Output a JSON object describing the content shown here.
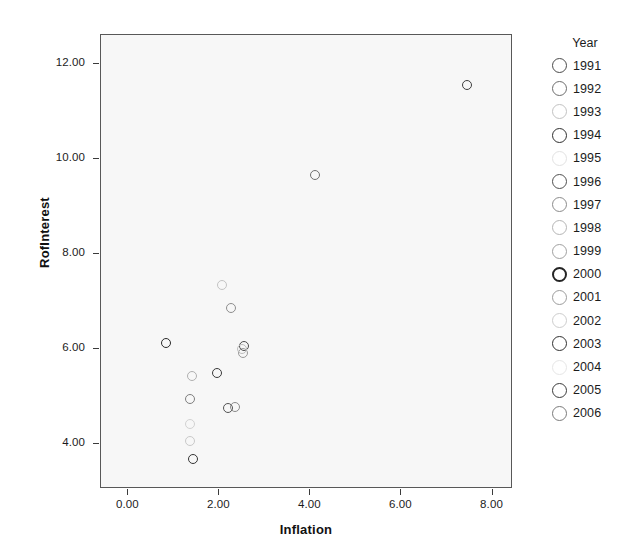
{
  "chart_data": {
    "type": "scatter",
    "title": "",
    "xlabel": "Inflation",
    "ylabel": "RofInterest",
    "xlim": [
      -0.6,
      8.45
    ],
    "ylim": [
      3.05,
      12.6
    ],
    "grid": false,
    "legend_position": "right",
    "legend_title": "Year",
    "xticks": [
      "0.00",
      "2.00",
      "4.00",
      "6.00",
      "8.00"
    ],
    "xtick_values": [
      0,
      2,
      4,
      6,
      8
    ],
    "yticks": [
      "4.00",
      "6.00",
      "8.00",
      "10.00",
      "12.00"
    ],
    "ytick_values": [
      4,
      6,
      8,
      10,
      12
    ],
    "series_name": "Year",
    "points": [
      {
        "label": "1991",
        "x": 7.45,
        "y": 11.55,
        "color": "#3f3f3f"
      },
      {
        "label": "1992",
        "x": 4.1,
        "y": 9.65,
        "color": "#707070"
      },
      {
        "label": "1993",
        "x": 2.05,
        "y": 7.35,
        "color": "#c3c3c3"
      },
      {
        "label": "1994",
        "x": 2.25,
        "y": 6.85,
        "color": "#8e8e8e"
      },
      {
        "label": "1995",
        "x": 0.82,
        "y": 6.12,
        "color": "#2b2b2b"
      },
      {
        "label": "1996",
        "x": 2.55,
        "y": 6.05,
        "color": "#4d4d4d"
      },
      {
        "label": "1997",
        "x": 2.52,
        "y": 5.92,
        "color": "#9a9a9a"
      },
      {
        "label": "1998",
        "x": 1.95,
        "y": 5.5,
        "color": "#3a3a3a"
      },
      {
        "label": "1999",
        "x": 1.4,
        "y": 5.42,
        "color": "#b0b0b0"
      },
      {
        "label": "2000",
        "x": 1.35,
        "y": 4.95,
        "color": "#7e7e7e"
      },
      {
        "label": "2001",
        "x": 2.18,
        "y": 4.75,
        "color": "#535353"
      },
      {
        "label": "2002",
        "x": 2.35,
        "y": 4.78,
        "color": "#8a8a8a"
      },
      {
        "label": "2003",
        "x": 1.35,
        "y": 4.42,
        "color": "#d2d2d2"
      },
      {
        "label": "2004",
        "x": 1.35,
        "y": 4.05,
        "color": "#c9c9c9"
      },
      {
        "label": "2005",
        "x": 1.42,
        "y": 3.68,
        "color": "#353535"
      },
      {
        "label": "2006",
        "x": 2.5,
        "y": 6.0,
        "color": "#bdbdbd"
      }
    ],
    "legend_entries": [
      {
        "label": "1991",
        "color": "#4a4a4a",
        "weight": 1.6
      },
      {
        "label": "1992",
        "color": "#6d6d6d",
        "weight": 1.4
      },
      {
        "label": "1993",
        "color": "#c2c2c2",
        "weight": 1.3
      },
      {
        "label": "1994",
        "color": "#2f2f2f",
        "weight": 1.9
      },
      {
        "label": "1995",
        "color": "#e2e2e2",
        "weight": 1.2
      },
      {
        "label": "1996",
        "color": "#4f4f4f",
        "weight": 1.7
      },
      {
        "label": "1997",
        "color": "#8b8b8b",
        "weight": 1.4
      },
      {
        "label": "1998",
        "color": "#b5b5b5",
        "weight": 1.3
      },
      {
        "label": "1999",
        "color": "#a0a0a0",
        "weight": 1.4
      },
      {
        "label": "2000",
        "color": "#252525",
        "weight": 2.1
      },
      {
        "label": "2001",
        "color": "#9c9c9c",
        "weight": 1.4
      },
      {
        "label": "2002",
        "color": "#cdcdcd",
        "weight": 1.2
      },
      {
        "label": "2003",
        "color": "#303030",
        "weight": 1.9
      },
      {
        "label": "2004",
        "color": "#e6e6e6",
        "weight": 1.2
      },
      {
        "label": "2005",
        "color": "#3b3b3b",
        "weight": 1.8
      },
      {
        "label": "2006",
        "color": "#7a7a7a",
        "weight": 1.5
      }
    ]
  },
  "style": {
    "plot_background": "#f7f7f7",
    "frame_color": "#585858",
    "text_color": "#1c1c1c",
    "page_background": "#ffffff"
  }
}
